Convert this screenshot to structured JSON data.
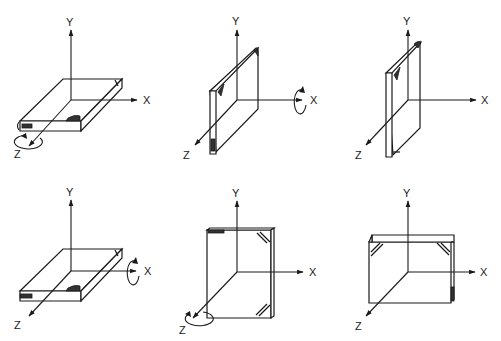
{
  "diagram": {
    "title": "",
    "axis_labels": {
      "x": "X",
      "y": "Y",
      "z": "Z"
    },
    "panels": [
      {
        "id": 1,
        "orientation": "flat, spine along X toward front",
        "rotation_axis": "Z",
        "x_label": "X",
        "y_label": "Y",
        "z_label": "Z"
      },
      {
        "id": 2,
        "orientation": "upright on long edge, faces ±X",
        "rotation_axis": "X",
        "x_label": "X",
        "y_label": "Y",
        "z_label": "Z"
      },
      {
        "id": 3,
        "orientation": "upright on short edge",
        "rotation_axis": "",
        "x_label": "X",
        "y_label": "Y",
        "z_label": "Z"
      },
      {
        "id": 4,
        "orientation": "flat, spine along X toward front",
        "rotation_axis": "X",
        "x_label": "X",
        "y_label": "Y",
        "z_label": "Z"
      },
      {
        "id": 5,
        "orientation": "upright facing Z, portrait",
        "rotation_axis": "Z",
        "x_label": "X",
        "y_label": "Y",
        "z_label": "Z"
      },
      {
        "id": 6,
        "orientation": "upright facing Z, landscape",
        "rotation_axis": "",
        "x_label": "X",
        "y_label": "Y",
        "z_label": "Z"
      }
    ],
    "colors": {
      "line": "#1a1a1a",
      "background": "#ffffff"
    }
  }
}
